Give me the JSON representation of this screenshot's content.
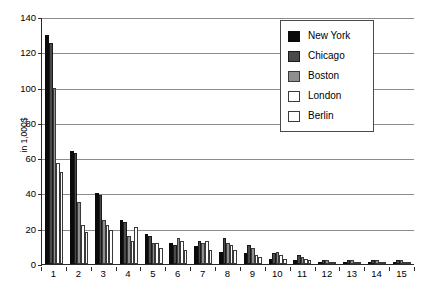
{
  "chart_data": {
    "type": "bar",
    "title": "",
    "subtitle": "",
    "xlabel": "",
    "ylabel": "in 1,000$",
    "ylim": [
      0,
      140
    ],
    "ytick_step": 20,
    "yticks": [
      0,
      20,
      40,
      60,
      80,
      100,
      120,
      140
    ],
    "grid": true,
    "grid_axis": "y",
    "legend_position": "top-right",
    "categories": [
      "1",
      "2",
      "3",
      "4",
      "5",
      "6",
      "7",
      "8",
      "9",
      "10",
      "11",
      "12",
      "13",
      "14",
      "15"
    ],
    "series": [
      {
        "name": "New York",
        "color": "#0a0a0a",
        "values": [
          130,
          64,
          40,
          25,
          17,
          12,
          10,
          7,
          6,
          3,
          2,
          1,
          1,
          1,
          1
        ]
      },
      {
        "name": "Chicago",
        "color": "#4a4a4a",
        "values": [
          125,
          63,
          39,
          24,
          16,
          11,
          13,
          15,
          11,
          6,
          5,
          2,
          2,
          2,
          2
        ]
      },
      {
        "name": "Boston",
        "color": "#8f8f8f",
        "values": [
          100,
          35,
          25,
          16,
          12,
          15,
          12,
          12,
          9,
          7,
          4,
          2,
          2,
          2,
          2
        ]
      },
      {
        "name": "London",
        "color": "#ffffff",
        "values": [
          57,
          22,
          22,
          13,
          12,
          13,
          13,
          11,
          5,
          5,
          3,
          1,
          1,
          1,
          1
        ]
      },
      {
        "name": "Berlin",
        "color": "#fdfdfd",
        "values": [
          52,
          18,
          19,
          21,
          9,
          8,
          8,
          8,
          4,
          3,
          2,
          1,
          1,
          1,
          1
        ]
      }
    ]
  },
  "axes": {
    "y_title": "in 1,000$",
    "y_tick_labels": [
      "140",
      "120",
      "100",
      "80",
      "60",
      "40",
      "20",
      "0"
    ],
    "x_tick_labels": [
      "1",
      "2",
      "3",
      "4",
      "5",
      "6",
      "7",
      "8",
      "9",
      "10",
      "11",
      "12",
      "13",
      "14",
      "15"
    ]
  },
  "legend": {
    "entries": [
      {
        "label": "New York",
        "swatch": "series-swatch-new-york"
      },
      {
        "label": "Chicago",
        "swatch": "series-swatch-chicago"
      },
      {
        "label": "Boston",
        "swatch": "series-swatch-boston"
      },
      {
        "label": "London",
        "swatch": "series-swatch-london"
      },
      {
        "label": "Berlin",
        "swatch": "series-swatch-berlin"
      }
    ]
  }
}
